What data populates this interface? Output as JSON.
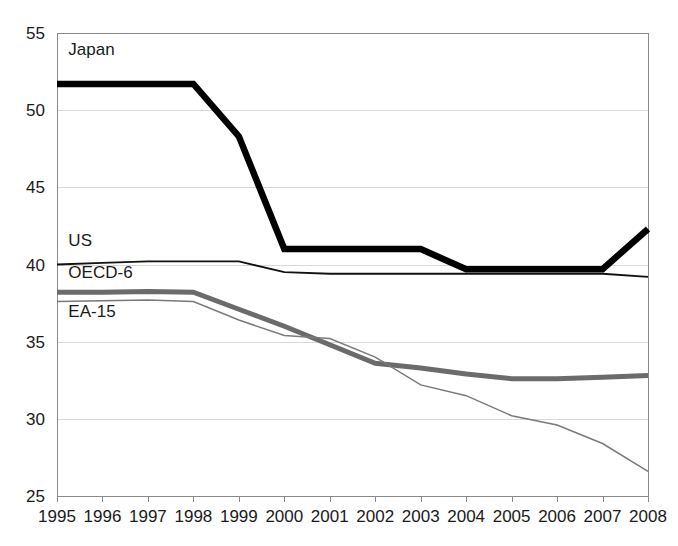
{
  "chart_data": {
    "type": "line",
    "title": "",
    "subtitle": "",
    "xlabel": "",
    "ylabel": "",
    "xlim": [
      1995,
      2008
    ],
    "ylim": [
      25,
      55
    ],
    "grid": true,
    "legend_position": "inline-labels",
    "categories": [
      "1995",
      "1996",
      "1997",
      "1998",
      "1999",
      "2000",
      "2001",
      "2002",
      "2003",
      "2004",
      "2005",
      "2006",
      "2007",
      "2008"
    ],
    "y_ticks": [
      "25",
      "30",
      "35",
      "40",
      "45",
      "50",
      "55"
    ],
    "series": [
      {
        "name": "Japan",
        "color": "#000000",
        "width": 6.5,
        "label_x": 1995.25,
        "label_y": 53.6,
        "values": [
          51.7,
          51.7,
          51.7,
          51.7,
          48.3,
          41.0,
          41.0,
          41.0,
          41.0,
          39.7,
          39.7,
          39.7,
          39.7,
          42.3
        ]
      },
      {
        "name": "US",
        "color": "#111111",
        "width": 1.8,
        "label_x": 1995.25,
        "label_y": 41.2,
        "values": [
          40.0,
          40.1,
          40.2,
          40.2,
          40.2,
          39.5,
          39.4,
          39.4,
          39.4,
          39.4,
          39.4,
          39.4,
          39.4,
          39.2
        ]
      },
      {
        "name": "OECD-6",
        "color": "#6b6b6b",
        "width": 5.0,
        "label_x": 1995.25,
        "label_y": 39.1,
        "values": [
          38.2,
          38.2,
          38.25,
          38.2,
          37.1,
          36.0,
          34.8,
          33.6,
          33.3,
          32.9,
          32.6,
          32.6,
          32.7,
          32.8
        ]
      },
      {
        "name": "EA-15",
        "color": "#7a7a7a",
        "width": 1.5,
        "label_x": 1995.25,
        "label_y": 36.6,
        "values": [
          37.6,
          37.65,
          37.7,
          37.6,
          36.4,
          35.4,
          35.2,
          34.0,
          32.2,
          31.5,
          30.2,
          29.6,
          28.4,
          26.6
        ]
      }
    ]
  },
  "plot": {
    "left": 57,
    "right": 648,
    "top": 33,
    "bottom": 496
  }
}
